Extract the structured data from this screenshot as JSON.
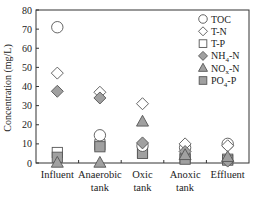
{
  "chart_data": {
    "type": "scatter",
    "title": "",
    "xlabel": "",
    "ylabel": "Concentration (mg/L)",
    "ylim": [
      0,
      80
    ],
    "yticks": [
      0,
      10,
      20,
      30,
      40,
      50,
      60,
      70,
      80
    ],
    "grid": false,
    "legend_position": "upper right",
    "categories": [
      "Influent",
      "Anaerobic tank",
      "Oxic tank",
      "Anoxic tank",
      "Effluent"
    ],
    "category_labels": [
      [
        "Influent"
      ],
      [
        "Anaerobic",
        "tank"
      ],
      [
        "Oxic",
        "tank"
      ],
      [
        "Anoxic",
        "tank"
      ],
      [
        "Effluent"
      ]
    ],
    "series": [
      {
        "name": "TOC",
        "marker": "circle",
        "fill": "#ffffff",
        "values": [
          71,
          14.5,
          9,
          8,
          10
        ]
      },
      {
        "name": "T-N",
        "marker": "diamond",
        "fill": "#ffffff",
        "values": [
          47,
          37,
          31,
          10,
          9
        ]
      },
      {
        "name": "T-P",
        "marker": "square",
        "fill": "#ffffff",
        "values": [
          5.5,
          9.5,
          5.5,
          2.5,
          2
        ]
      },
      {
        "name": "NH4-N",
        "marker": "diamond",
        "fill": "#a0a0a0",
        "values": [
          37.5,
          34,
          10.5,
          6,
          1
        ]
      },
      {
        "name": "NOx-N",
        "marker": "triangle",
        "fill": "#a0a0a0",
        "values": [
          0,
          0,
          21.5,
          4,
          3
        ]
      },
      {
        "name": "PO4-P",
        "marker": "square",
        "fill": "#a0a0a0",
        "values": [
          3,
          8.5,
          5,
          2,
          1.5
        ]
      }
    ],
    "legend": [
      {
        "base": "TOC",
        "sub": ""
      },
      {
        "base": "T-N",
        "sub": ""
      },
      {
        "base": "T-P",
        "sub": ""
      },
      {
        "base": "NH",
        "sub": "4",
        "suffix": "-N"
      },
      {
        "base": "NO",
        "sub": "x",
        "suffix": "-N"
      },
      {
        "base": "PO",
        "sub": "4",
        "suffix": "-P"
      }
    ]
  }
}
